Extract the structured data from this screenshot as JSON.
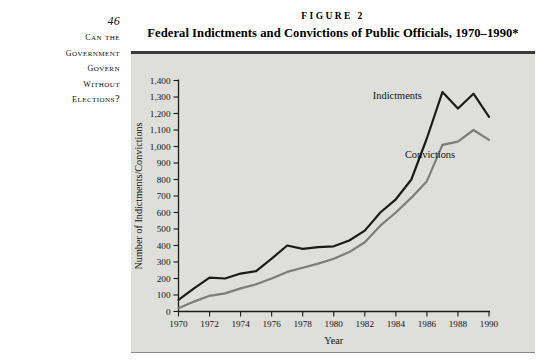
{
  "page": {
    "folio": "46",
    "running_head_lines": [
      "Can the",
      "Government",
      "Govern",
      "without",
      "Elections?"
    ]
  },
  "figure": {
    "number_label": "FIGURE 2",
    "title": "Federal Indictments and Convictions of Public Officials, 1970–1990*"
  },
  "chart_data": {
    "type": "line",
    "title": "Federal Indictments and Convictions of Public Officials, 1970–1990*",
    "xlabel": "Year",
    "ylabel": "Number of Indictments/Convictions",
    "xlim": [
      1970,
      1990
    ],
    "ylim": [
      0,
      1400
    ],
    "grid": false,
    "legend_position": "inline-annotations",
    "x_tick_labels": [
      "1970",
      "1972",
      "1974",
      "1976",
      "1978",
      "1980",
      "1982",
      "1984",
      "1986",
      "1988",
      "1990"
    ],
    "x_tick_values": [
      1970,
      1972,
      1974,
      1976,
      1978,
      1980,
      1982,
      1984,
      1986,
      1988,
      1990
    ],
    "y_tick_labels": [
      "0",
      "100",
      "200",
      "300",
      "400",
      "500",
      "600",
      "700",
      "800",
      "900",
      "1,000",
      "1,100",
      "1,200",
      "1,300",
      "1,400"
    ],
    "y_tick_values": [
      0,
      100,
      200,
      300,
      400,
      500,
      600,
      700,
      800,
      900,
      1000,
      1100,
      1200,
      1300,
      1400
    ],
    "x": [
      1970,
      1971,
      1972,
      1973,
      1974,
      1975,
      1976,
      1977,
      1978,
      1979,
      1980,
      1981,
      1982,
      1983,
      1984,
      1985,
      1986,
      1987,
      1988,
      1989,
      1990
    ],
    "series": [
      {
        "name": "Indictments",
        "color": "#1b1b1b",
        "values": [
          70,
          140,
          205,
          200,
          230,
          245,
          320,
          400,
          380,
          390,
          395,
          430,
          490,
          600,
          680,
          800,
          1050,
          1330,
          1230,
          1320,
          1180
        ]
      },
      {
        "name": "Convictions",
        "color": "#7d7d7d",
        "values": [
          20,
          60,
          95,
          110,
          140,
          165,
          200,
          240,
          265,
          290,
          320,
          360,
          420,
          520,
          600,
          690,
          790,
          1010,
          1030,
          1100,
          1040
        ]
      }
    ],
    "annotations": [
      {
        "text": "Indictments",
        "x": 1984.1,
        "y": 1290
      },
      {
        "text": "Convictions",
        "x": 1986.2,
        "y": 930
      }
    ]
  }
}
